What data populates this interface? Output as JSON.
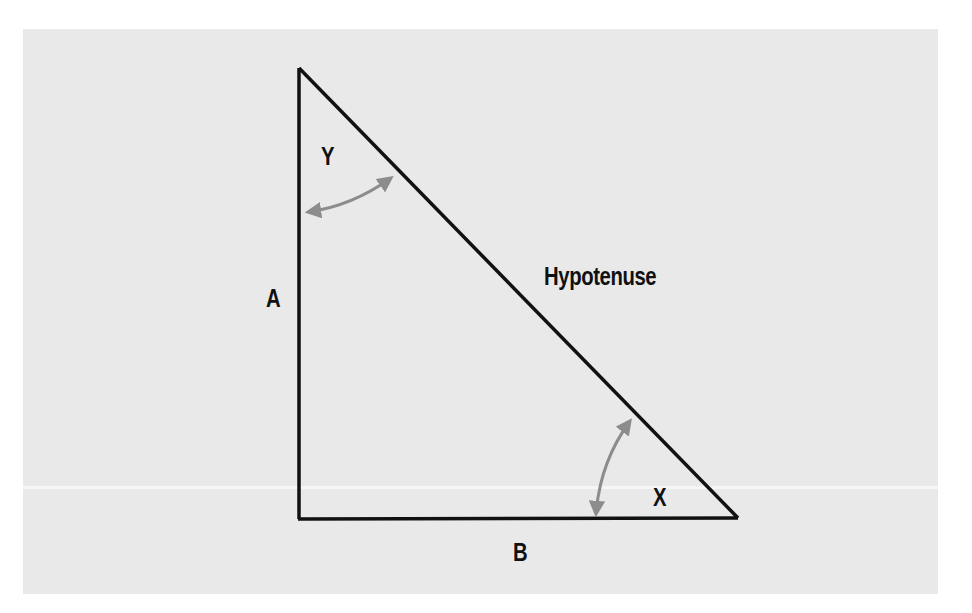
{
  "diagram": {
    "type": "right-triangle",
    "colors": {
      "background": "#e9e9e9",
      "stroke": "#111111",
      "arrow": "#8c8c8c",
      "text": "#111111"
    },
    "vertices": {
      "top": [
        298,
        68
      ],
      "right_angle": [
        300,
        519
      ],
      "right": [
        738,
        518
      ]
    },
    "labels": {
      "angle_top": "Y",
      "angle_bottom_right": "X",
      "side_vertical": "A",
      "side_horizontal": "B",
      "hypotenuse": "Hypotenuse"
    },
    "angle_arrows": [
      {
        "angle": "Y",
        "from": [
          305,
          214
        ],
        "to": [
          394,
          176
        ],
        "curve": "arc-down"
      },
      {
        "angle": "X",
        "from": [
          633,
          418
        ],
        "to": [
          595,
          518
        ],
        "curve": "arc-left"
      }
    ]
  }
}
